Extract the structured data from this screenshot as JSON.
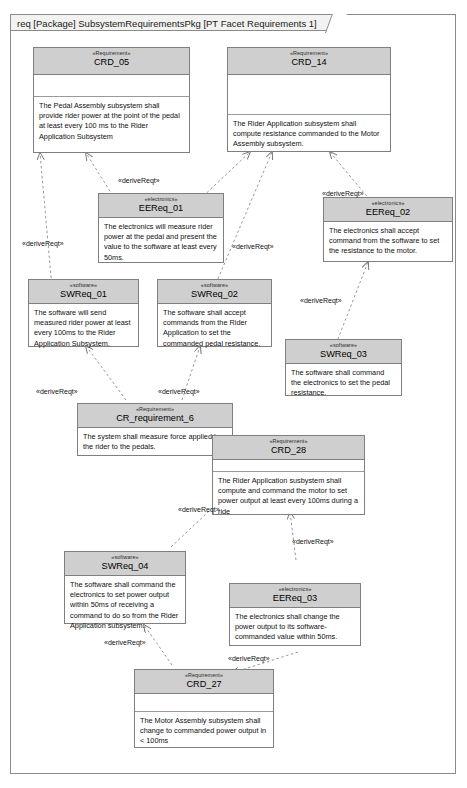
{
  "diagram": {
    "frame_label": "req [Package] SubsystemRequirementsPkg [PT Facet Requirements 1]",
    "kind": "SysML Requirement Diagram",
    "colors": {
      "header_fill": "#cfcfcf",
      "block_fill": "#ffffff",
      "border": "#7f7f7f",
      "frame_tab_fill": "#f2f2f0",
      "connector": "#808080"
    }
  },
  "blocks": [
    {
      "id": "CRD_05",
      "stereotype": "«Requirement»",
      "name": "CRD_05",
      "text": "The Pedal Assembly subsystem shall provide rider power at the point of the pedal at least every 100 ms to the Rider Application Subsystem"
    },
    {
      "id": "CRD_14",
      "stereotype": "«Requirement»",
      "name": "CRD_14",
      "text": "The Rider Application subsystem shall compute resistance commanded to the Motor Assembly subsystem."
    },
    {
      "id": "EEReq_01",
      "stereotype": "«electronics»",
      "name": "EEReq_01",
      "text": "The electronics will measure rider power at the pedal and present the value to the software at least every 50ms."
    },
    {
      "id": "EEReq_02",
      "stereotype": "«electronics»",
      "name": "EEReq_02",
      "text": "The electronics shall accept command from the software to set the resistance to the motor."
    },
    {
      "id": "SWReq_01",
      "stereotype": "«software»",
      "name": "SWReq_01",
      "text": "The software will send measured rider power at least every 100ms to the Rider Application Subsystem."
    },
    {
      "id": "SWReq_02",
      "stereotype": "«software»",
      "name": "SWReq_02",
      "text": "The software shall accept commands from the Rider Application to set the commanded pedal resistance."
    },
    {
      "id": "SWReq_03",
      "stereotype": "«software»",
      "name": "SWReq_03",
      "text": "The software shall command the electronics to set the pedal resistance."
    },
    {
      "id": "CR_requirement_6",
      "stereotype": "«Requirement»",
      "name": "CR_requirement_6",
      "text": "The system shall measure force applied by the rider to the pedals."
    },
    {
      "id": "CRD_28",
      "stereotype": "«Requirement»",
      "name": "CRD_28",
      "text": "The Rider Application susbystem shall compute and command the motor to set power output at least every 100ms during a ride"
    },
    {
      "id": "SWReq_04",
      "stereotype": "«software»",
      "name": "SWReq_04",
      "text": "The software shall command the electronics to set power output within 50ms of receiving a command to do so from the Rider Application subsystem."
    },
    {
      "id": "EEReq_03",
      "stereotype": "«electronics»",
      "name": "EEReq_03",
      "text": "The electronics shall change the power output to its software-commanded value within 50ms."
    },
    {
      "id": "CRD_27",
      "stereotype": "«Requirement»",
      "name": "CRD_27",
      "text": "The Motor Assembly subsystem shall change to commanded power output in < 100ms"
    }
  ],
  "edge_labels": {
    "e1": "«deriveReqt»",
    "e2": "«deriveReqt»",
    "e3": "«deriveReqt»",
    "e4": "«deriveReqt»",
    "e5": "«deriveReqt»",
    "e6": "«deriveReqt»",
    "e7": "«deriveReqt»",
    "e8": "«deriveReqt»",
    "e9": "«deriveReqt»",
    "e10": "«deriveReqt»",
    "e11": "«deriveReqt»"
  },
  "relationships": [
    {
      "from": "EEReq_01",
      "to": "CRD_05",
      "type": "deriveReqt"
    },
    {
      "from": "SWReq_01",
      "to": "CRD_05",
      "type": "deriveReqt"
    },
    {
      "from": "EEReq_01",
      "to": "CRD_14",
      "type": "deriveReqt"
    },
    {
      "from": "SWReq_02",
      "to": "CRD_14",
      "type": "deriveReqt"
    },
    {
      "from": "EEReq_02",
      "to": "CRD_14",
      "type": "deriveReqt"
    },
    {
      "from": "SWReq_03",
      "to": "EEReq_02",
      "type": "deriveReqt"
    },
    {
      "from": "CR_requirement_6",
      "to": "SWReq_01",
      "type": "deriveReqt"
    },
    {
      "from": "CR_requirement_6",
      "to": "SWReq_02",
      "type": "deriveReqt"
    },
    {
      "from": "SWReq_04",
      "to": "CRD_28",
      "type": "deriveReqt"
    },
    {
      "from": "EEReq_03",
      "to": "CRD_28",
      "type": "deriveReqt"
    },
    {
      "from": "CRD_27",
      "to": "SWReq_04",
      "type": "deriveReqt"
    },
    {
      "from": "CRD_27",
      "to": "EEReq_03",
      "type": "deriveReqt"
    }
  ]
}
